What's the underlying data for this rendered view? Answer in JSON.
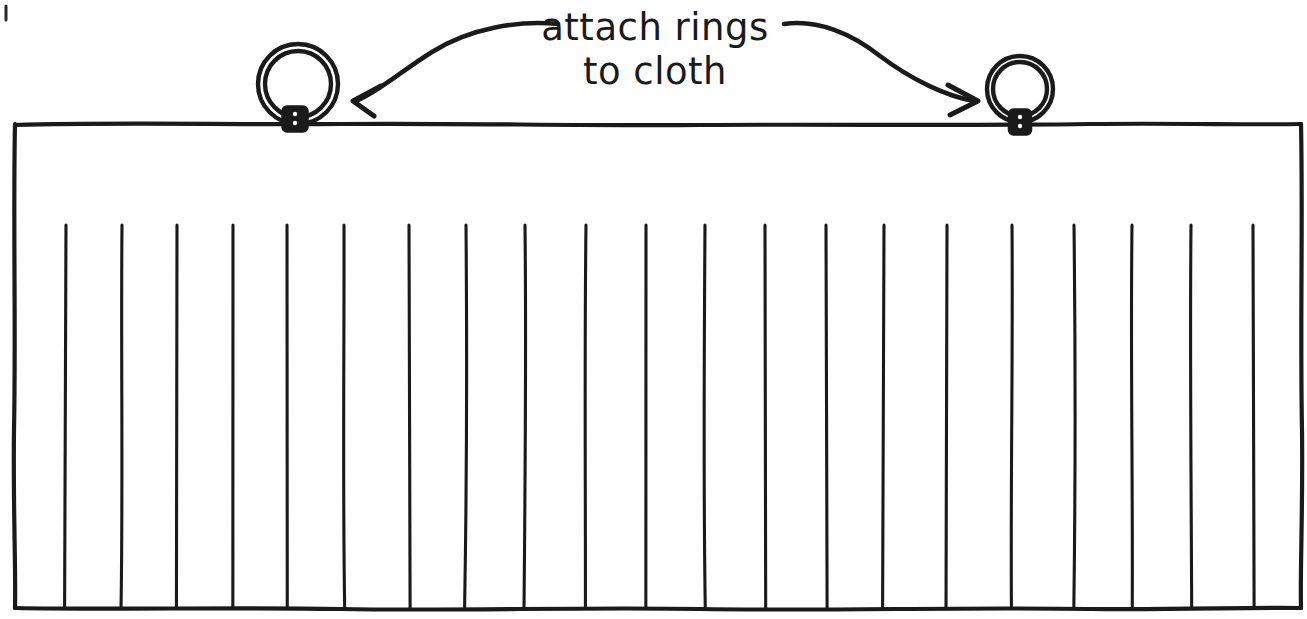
{
  "document": {
    "title": "attach rings to cloth",
    "type": "hand-drawn instructional diagram",
    "ink_color": "#1a1a1a",
    "background_color": "#ffffff",
    "canvas": {
      "width": 1307,
      "height": 619
    }
  },
  "annotation": {
    "line1": "attach rings",
    "line2": "to cloth",
    "full_text": "attach rings to cloth",
    "x": 655,
    "y_line1": 28,
    "y_line2": 72
  },
  "arrows": [
    {
      "name": "left-arrow",
      "direction": "left",
      "from": {
        "x": 558,
        "y": 24
      },
      "to": {
        "x": 352,
        "y": 101
      },
      "path": "M 558 24 C 520 20 470 28 432 52 C 400 72 378 92 356 101",
      "head_path": "M 381 86 L 353 101 L 374 116"
    },
    {
      "name": "right-arrow",
      "direction": "right",
      "from": {
        "x": 784,
        "y": 24
      },
      "to": {
        "x": 978,
        "y": 101
      },
      "path": "M 784 24 C 818 19 852 34 880 56 C 912 80 946 96 974 101",
      "head_path": "M 948 85 L 978 101 L 950 115"
    }
  ],
  "rings": [
    {
      "name": "left-ring",
      "cx": 298,
      "cy": 84,
      "outer_radius": 40,
      "inner_radius": 33,
      "knot": {
        "x": 295,
        "y": 119,
        "width": 26,
        "height": 26
      }
    },
    {
      "name": "right-ring",
      "cx": 1020,
      "cy": 89,
      "outer_radius": 33,
      "inner_radius": 27,
      "knot": {
        "x": 1020,
        "y": 122,
        "width": 23,
        "height": 26
      }
    }
  ],
  "cloth": {
    "name": "cloth-panel",
    "top_y": 124,
    "bottom_y": 608,
    "left_x": 14,
    "right_x": 1301,
    "header_band_bottom_y": 225,
    "pleat_count": 22,
    "pleat_x_positions": [
      66,
      122,
      177,
      233,
      287,
      344,
      409,
      466,
      525,
      586,
      646,
      705,
      765,
      826,
      884,
      947,
      1012,
      1074,
      1132,
      1191,
      1253
    ]
  },
  "marks": {
    "corner_tick": {
      "x": 6,
      "y1": 6,
      "y2": 20
    }
  }
}
